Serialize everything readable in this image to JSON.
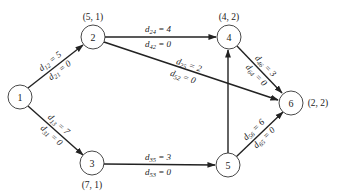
{
  "diagram": {
    "type": "directed network",
    "nodes": [
      {
        "id": "1",
        "label": "1",
        "coord": "",
        "x": 20,
        "y": 97
      },
      {
        "id": "2",
        "label": "2",
        "coord": "(5, 1)",
        "x": 93,
        "y": 37
      },
      {
        "id": "3",
        "label": "3",
        "coord": "(7, 1)",
        "x": 92,
        "y": 163
      },
      {
        "id": "4",
        "label": "4",
        "coord": "(4, 2)",
        "x": 229,
        "y": 37
      },
      {
        "id": "5",
        "label": "5",
        "coord": "",
        "x": 228,
        "y": 165
      },
      {
        "id": "6",
        "label": "6",
        "coord": "(2, 2)",
        "x": 291,
        "y": 103
      }
    ],
    "edges": [
      {
        "from": "1",
        "to": "2",
        "forward": "d12 = 5",
        "backward": "d21 = 0"
      },
      {
        "from": "1",
        "to": "3",
        "forward": "d13 = 7",
        "backward": "d31 = 0"
      },
      {
        "from": "2",
        "to": "4",
        "forward": "d24 = 4",
        "backward": "d42 = 0"
      },
      {
        "from": "2",
        "to": "6",
        "forward": "d25 = 2",
        "backward": "d52 = 0"
      },
      {
        "from": "3",
        "to": "5",
        "forward": "d35 = 3",
        "backward": "d53 = 0"
      },
      {
        "from": "5",
        "to": "4",
        "forward": "",
        "backward": ""
      },
      {
        "from": "4",
        "to": "6",
        "forward": "d46 = 3",
        "backward": "d64 = 0"
      },
      {
        "from": "5",
        "to": "6",
        "forward": "d56 = 6",
        "backward": "d65 = 0"
      }
    ],
    "labels": {
      "n1": "1",
      "n2": "2",
      "n3": "3",
      "n4": "4",
      "n5": "5",
      "n6": "6",
      "c2": "(5, 1)",
      "c3": "(7, 1)",
      "c4": "(4, 2)",
      "c6": "(2, 2)",
      "e12": {
        "f_main": "d",
        "f_sub": "12",
        "f_val": " = 5",
        "b_main": "d",
        "b_sub": "21",
        "b_val": " = 0"
      },
      "e13": {
        "f_main": "d",
        "f_sub": "13",
        "f_val": " = 7",
        "b_main": "d",
        "b_sub": "31",
        "b_val": " = 0"
      },
      "e24": {
        "f_main": "d",
        "f_sub": "24",
        "f_val": " = 4",
        "b_main": "d",
        "b_sub": "42",
        "b_val": " = 0"
      },
      "e25": {
        "f_main": "d",
        "f_sub": "25",
        "f_val": " = 2",
        "b_main": "d",
        "b_sub": "52",
        "b_val": " = 0"
      },
      "e35": {
        "f_main": "d",
        "f_sub": "35",
        "f_val": " = 3",
        "b_main": "d",
        "b_sub": "53",
        "b_val": " = 0"
      },
      "e46": {
        "f_main": "d",
        "f_sub": "46",
        "f_val": " = 3",
        "b_main": "d",
        "b_sub": "64",
        "b_val": " = 0"
      },
      "e56": {
        "f_main": "d",
        "f_sub": "56",
        "f_val": " = 6",
        "b_main": "d",
        "b_sub": "65",
        "b_val": " = 0"
      }
    },
    "colors": {
      "stroke": "#222222",
      "background": "#ffffff"
    }
  }
}
